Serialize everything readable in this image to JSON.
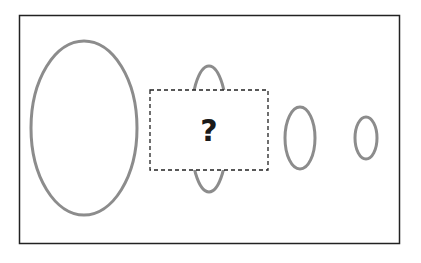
{
  "puzzle": {
    "question_mark": "?",
    "colors": {
      "frame": "#222222",
      "ellipse_stroke": "#8c8c8c",
      "dashed_box": "#222222",
      "question_mark": "#1a1a1a"
    },
    "shapes": [
      {
        "type": "ellipse",
        "label": "large-ellipse",
        "cx": 84,
        "cy": 128,
        "rx": 53,
        "ry": 87
      },
      {
        "type": "ellipse",
        "label": "partially-hidden-ellipse",
        "cx": 209,
        "cy": 129,
        "rx": 19,
        "ry": 63
      },
      {
        "type": "ellipse",
        "label": "medium-ellipse",
        "cx": 300,
        "cy": 138,
        "rx": 15,
        "ry": 31
      },
      {
        "type": "ellipse",
        "label": "small-ellipse",
        "cx": 366,
        "cy": 138,
        "rx": 11,
        "ry": 21
      }
    ],
    "missing_box": {
      "x": 150,
      "y": 90,
      "width": 118,
      "height": 80
    }
  }
}
